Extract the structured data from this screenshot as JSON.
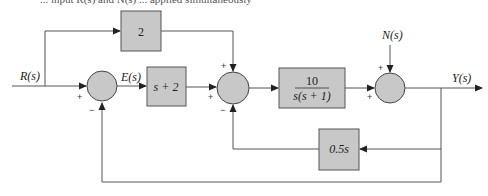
{
  "caption_fragment": "... input R(s) and N(s) ... applied simultaneously",
  "signals": {
    "input": "R(s)",
    "error": "E(s)",
    "disturbance": "N(s)",
    "output": "Y(s)"
  },
  "blocks": {
    "feedforward_gain": "2",
    "controller": "s + 2",
    "plant_num": "10",
    "plant_den": "s(s + 1)",
    "feedback": "0.5s"
  },
  "summing_junctions": [
    {
      "name": "sum1",
      "signs": {
        "left": "+",
        "bottom": "−"
      }
    },
    {
      "name": "sum2",
      "signs": {
        "top": "+",
        "left": "+",
        "bottom": "−"
      }
    },
    {
      "name": "sum3",
      "signs": {
        "top": "+",
        "left": "+"
      }
    }
  ],
  "colors": {
    "block_fill": "#c8c8c8",
    "line": "#555555"
  }
}
